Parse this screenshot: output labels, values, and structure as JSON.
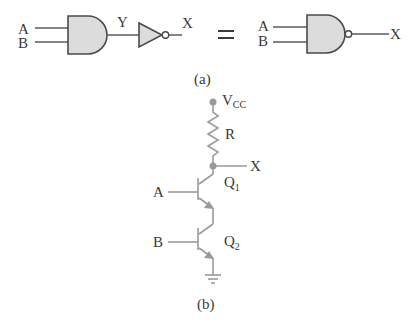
{
  "part_a": {
    "caption": "(a)",
    "left": {
      "input_a": "A",
      "input_b": "B",
      "intermediate": "Y",
      "output": "X",
      "gates": [
        "AND",
        "NOT"
      ]
    },
    "equals": "=",
    "right": {
      "input_a": "A",
      "input_b": "B",
      "output": "X",
      "gates": [
        "NAND"
      ]
    }
  },
  "part_b": {
    "caption": "(b)",
    "supply": "V",
    "supply_sub": "CC",
    "resistor": "R",
    "output": "X",
    "input_a": "A",
    "input_b": "B",
    "q1": "Q",
    "q1_sub": "1",
    "q2": "Q",
    "q2_sub": "2"
  },
  "colors": {
    "gate_fill": "#dcdcdc",
    "wire": "#5a5a5a",
    "circuit_gray": "#9a9a9a"
  }
}
